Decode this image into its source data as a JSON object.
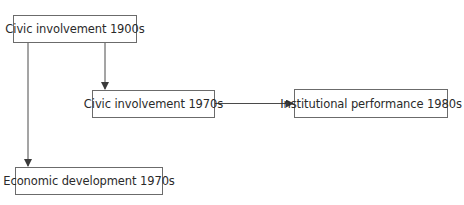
{
  "diagram": {
    "nodes": [
      {
        "id": "n1",
        "label": "Civic involvement 1900s"
      },
      {
        "id": "n2",
        "label": "Civic involvement 1970s"
      },
      {
        "id": "n3",
        "label": "Institutional performance 1980s"
      },
      {
        "id": "n4",
        "label": "Economic development 1970s"
      }
    ],
    "edges": [
      {
        "from": "n1",
        "to": "n2"
      },
      {
        "from": "n1",
        "to": "n4"
      },
      {
        "from": "n2",
        "to": "n3"
      }
    ],
    "colors": {
      "line": "#4a4a4a",
      "border": "#6b6b6b",
      "text": "#2a2a2a",
      "background": "#ffffff"
    }
  }
}
